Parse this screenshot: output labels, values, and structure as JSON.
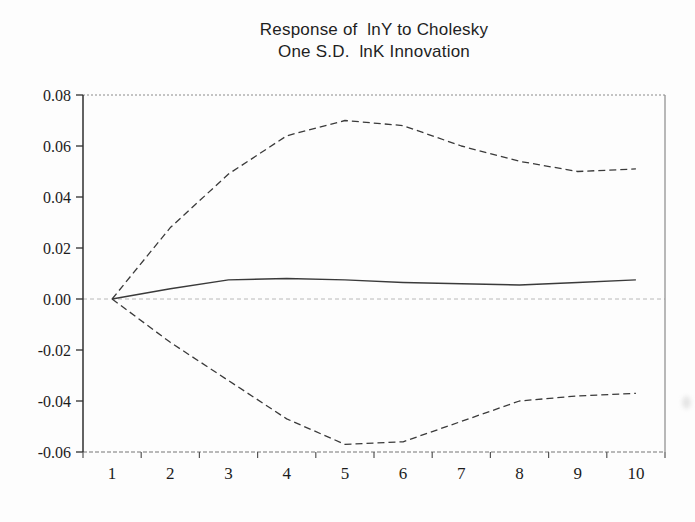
{
  "header": {
    "title_line1": "Response of  lnY to Cholesky",
    "title_line2": "One S.D.  lnK Innovation"
  },
  "chart_data": {
    "type": "line",
    "title": "Response of lnY to Cholesky One S.D. lnK Innovation",
    "subtitle_note": "impulse response with ±2 S.E. dashed bands",
    "x": [
      1,
      2,
      3,
      4,
      5,
      6,
      7,
      8,
      9,
      10
    ],
    "xtick_labels": [
      "1",
      "2",
      "3",
      "4",
      "5",
      "6",
      "7",
      "8",
      "9",
      "10"
    ],
    "series": [
      {
        "name": "response",
        "style": "solid",
        "values": [
          0.0,
          0.004,
          0.0075,
          0.008,
          0.0075,
          0.0065,
          0.006,
          0.0055,
          0.0065,
          0.0075
        ]
      },
      {
        "name": "upper-band",
        "style": "dashed",
        "values": [
          0.0,
          0.028,
          0.049,
          0.064,
          0.07,
          0.068,
          0.06,
          0.054,
          0.05,
          0.051
        ]
      },
      {
        "name": "lower-band",
        "style": "dashed",
        "values": [
          0.0,
          -0.017,
          -0.032,
          -0.047,
          -0.057,
          -0.056,
          -0.048,
          -0.04,
          -0.038,
          -0.037
        ]
      }
    ],
    "xlabel": "",
    "ylabel": "",
    "ylim": [
      -0.06,
      0.08
    ],
    "yticks": [
      0.08,
      0.06,
      0.04,
      0.02,
      0.0,
      -0.02,
      -0.04,
      -0.06
    ],
    "ytick_labels": [
      "0.08",
      "0.06",
      "0.04",
      "0.02",
      "0.00",
      "-0.02",
      "-0.04",
      "-0.06"
    ],
    "zero_line": true,
    "grid": false,
    "legend": "none",
    "colors": {
      "line": "#3a3a3a",
      "zero_line": "#b8b8b8",
      "frame": "#8a8a8a",
      "axis": "#2f2f2f",
      "text": "#1c1c1c",
      "background": "#fdfdfd"
    }
  }
}
